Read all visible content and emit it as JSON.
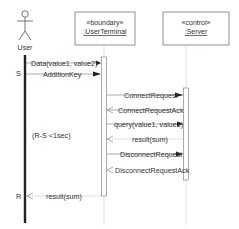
{
  "diagram": {
    "type": "uml-sequence",
    "actor": {
      "label": "User"
    },
    "participants": [
      {
        "stereotype": "«boundary»",
        "name": ":UserTerminal"
      },
      {
        "stereotype": "«control»",
        "name": ":Server"
      }
    ],
    "markers": {
      "start": "S",
      "end": "R"
    },
    "constraint": "(R-S <1sec)",
    "messages": [
      {
        "label": "Data(value1, value2)",
        "from": "User",
        "to": ":UserTerminal",
        "kind": "sync"
      },
      {
        "label": "AdditionKey",
        "from": "User",
        "to": ":UserTerminal",
        "kind": "sync"
      },
      {
        "label": "ConnectRequest",
        "from": ":UserTerminal",
        "to": ":Server",
        "kind": "sync"
      },
      {
        "label": "ConnectRequestAck",
        "from": ":Server",
        "to": ":UserTerminal",
        "kind": "async"
      },
      {
        "label": "query(value1, value2)",
        "from": ":UserTerminal",
        "to": ":Server",
        "kind": "sync"
      },
      {
        "label": "result(sum)",
        "from": ":Server",
        "to": ":UserTerminal",
        "kind": "return"
      },
      {
        "label": "DisconnectRequest",
        "from": ":UserTerminal",
        "to": ":Server",
        "kind": "sync"
      },
      {
        "label": "DisconnectRequestAck",
        "from": ":Server",
        "to": ":UserTerminal",
        "kind": "async"
      },
      {
        "label": "result(sum)",
        "from": ":UserTerminal",
        "to": "User",
        "kind": "return"
      }
    ]
  }
}
